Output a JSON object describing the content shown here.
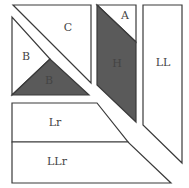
{
  "diagram": {
    "colors": {
      "light": "#ffffff",
      "dark": "#5a5a5a",
      "stroke": "#3a3a3a"
    },
    "pieces": [
      {
        "id": "C",
        "label": "C",
        "shade": "light"
      },
      {
        "id": "B-light",
        "label": "B",
        "shade": "light"
      },
      {
        "id": "B-dark",
        "label": "B",
        "shade": "dark"
      },
      {
        "id": "A",
        "label": "A",
        "shade": "light"
      },
      {
        "id": "H",
        "label": "H",
        "shade": "dark"
      },
      {
        "id": "LL",
        "label": "LL",
        "shade": "light"
      },
      {
        "id": "Lr",
        "label": "Lr",
        "shade": "light"
      },
      {
        "id": "LLr",
        "label": "LLr",
        "shade": "light"
      }
    ]
  }
}
